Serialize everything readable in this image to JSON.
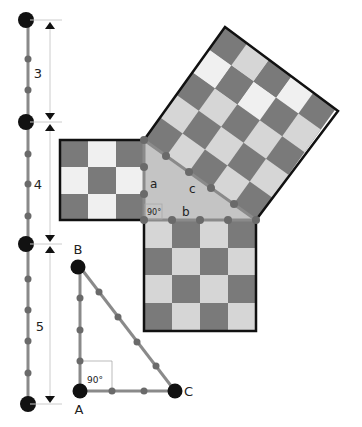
{
  "colors": {
    "dark_tile": "#7a7a7a",
    "light_tile": "#d6d6d6",
    "white_tile": "#f0f0f0",
    "triangle_fill": "#c4c4c4",
    "rope": "#8a8a8a",
    "knot": "#6a6a6a",
    "stake": "#111111",
    "outline": "#111111",
    "dimension_line": "#cccccc"
  },
  "ruler": {
    "segments": [
      {
        "label": "3"
      },
      {
        "label": "4"
      },
      {
        "label": "5"
      }
    ]
  },
  "big_triangle": {
    "side_a": "a",
    "side_b": "b",
    "side_c": "c",
    "right_angle_label": "90°"
  },
  "rope_triangle": {
    "vertex_a": "A",
    "vertex_b": "B",
    "vertex_c": "C",
    "right_angle_label": "90°"
  }
}
